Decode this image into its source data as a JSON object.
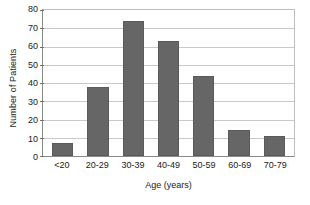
{
  "chart_data": {
    "type": "bar",
    "title": "",
    "subtitle": "",
    "xlabel": "Age (years)",
    "ylabel": "Number of Patients",
    "categories": [
      "<20",
      "20-29",
      "30-39",
      "40-49",
      "50-59",
      "60-69",
      "70-79"
    ],
    "values": [
      7,
      38,
      74,
      63,
      44,
      14,
      11
    ],
    "ylim": [
      0,
      80
    ],
    "ytick_values": [
      0,
      10,
      20,
      30,
      40,
      50,
      60,
      70,
      80
    ],
    "ytick_labels": [
      "0",
      "10",
      "20",
      "30",
      "40",
      "50",
      "60",
      "70",
      "80"
    ],
    "grid": true,
    "grid_axis": "y",
    "legend": false,
    "legend_position": "none",
    "annotations": [],
    "colors": {
      "bar_fill": "#666666",
      "bar_edge": "#5a5a5a",
      "gridline": "#c9c9c9",
      "axis_line": "#8a8a8a",
      "frame_line": "#bdbdbd",
      "background": "#ffffff",
      "text": "#1a1a1a"
    }
  }
}
